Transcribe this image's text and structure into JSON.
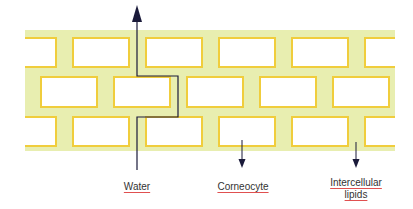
{
  "diagram": {
    "title": "",
    "colors": {
      "lipid_band": "#e8eeb0",
      "cell_border": "#f0cd3c",
      "cell_fill": "#ffffff",
      "arrow": "#1a1a3a",
      "label_underline": "#e05050"
    },
    "labels": {
      "water": "Water",
      "corneocyte": "Corneocyte",
      "lipids_line1": "Intercellular",
      "lipids_line2": "lipids"
    },
    "rows": 3
  }
}
